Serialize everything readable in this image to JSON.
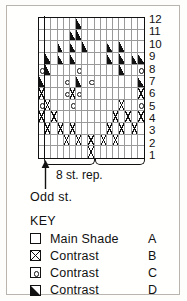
{
  "chart_data": {
    "type": "table",
    "rows": 12,
    "columns": 17,
    "row_labels": [
      "12",
      "11",
      "10",
      "9",
      "8",
      "7",
      "6",
      "5",
      "4",
      "3",
      "2",
      "1"
    ],
    "row_label_position": "right",
    "odd_stitch_columns": 1,
    "repeat_width": 8,
    "repeat_count": 2,
    "symbols": {
      "A": "blank",
      "B": "cross",
      "C": "circle",
      "D": "triangle"
    },
    "legend_position": "bottom",
    "grid": [
      {
        "row": "12",
        "cells": [
          "A",
          "A",
          "A",
          "A",
          "A",
          "A",
          "D",
          "A",
          "A",
          "A",
          "A",
          "A",
          "A",
          "A",
          "A",
          "A",
          "A"
        ]
      },
      {
        "row": "11",
        "cells": [
          "A",
          "A",
          "A",
          "A",
          "A",
          "D",
          "D",
          "A",
          "A",
          "A",
          "A",
          "A",
          "A",
          "A",
          "A",
          "A",
          "A"
        ]
      },
      {
        "row": "10",
        "cells": [
          "A",
          "A",
          "A",
          "D",
          "A",
          "D",
          "A",
          "D",
          "A",
          "A",
          "A",
          "D",
          "A",
          "D",
          "A",
          "A",
          "A"
        ]
      },
      {
        "row": "9",
        "cells": [
          "A",
          "D",
          "A",
          "D",
          "A",
          "D",
          "A",
          "A",
          "A",
          "A",
          "A",
          "D",
          "A",
          "D",
          "A",
          "D",
          "D"
        ]
      },
      {
        "row": "8",
        "cells": [
          "C",
          "D",
          "A",
          "A",
          "A",
          "A",
          "C",
          "A",
          "A",
          "A",
          "A",
          "A",
          "A",
          "D",
          "A",
          "A",
          "C"
        ]
      },
      {
        "row": "7",
        "cells": [
          "D",
          "A",
          "A",
          "A",
          "C",
          "A",
          "D",
          "A",
          "C",
          "A",
          "A",
          "A",
          "A",
          "A",
          "A",
          "A",
          "D"
        ]
      },
      {
        "row": "6",
        "cells": [
          "B",
          "A",
          "A",
          "A",
          "C",
          "B",
          "C",
          "A",
          "A",
          "A",
          "A",
          "A",
          "A",
          "A",
          "A",
          "A",
          "B"
        ]
      },
      {
        "row": "5",
        "cells": [
          "C",
          "B",
          "A",
          "A",
          "A",
          "C",
          "A",
          "A",
          "A",
          "A",
          "A",
          "A",
          "A",
          "B",
          "A",
          "A",
          "C"
        ]
      },
      {
        "row": "4",
        "cells": [
          "B",
          "A",
          "B",
          "A",
          "A",
          "A",
          "A",
          "A",
          "A",
          "A",
          "A",
          "A",
          "B",
          "A",
          "B",
          "A",
          "B"
        ]
      },
      {
        "row": "3",
        "cells": [
          "A",
          "B",
          "A",
          "B",
          "A",
          "B",
          "A",
          "A",
          "A",
          "A",
          "A",
          "B",
          "A",
          "B",
          "A",
          "B",
          "A"
        ]
      },
      {
        "row": "2",
        "cells": [
          "A",
          "A",
          "A",
          "A",
          "B",
          "A",
          "B",
          "A",
          "B",
          "A",
          "B",
          "A",
          "B",
          "A",
          "A",
          "A",
          "A"
        ]
      },
      {
        "row": "1",
        "cells": [
          "A",
          "A",
          "A",
          "A",
          "A",
          "A",
          "A",
          "A",
          "B",
          "A",
          "A",
          "A",
          "A",
          "A",
          "A",
          "A",
          "A"
        ]
      }
    ]
  },
  "chart": {
    "repeat_label": "8 st. rep.",
    "odd_stitch_label": "Odd st."
  },
  "key": {
    "title": "KEY",
    "items": [
      {
        "symbol": "A",
        "label": "Main Shade",
        "letter": "A"
      },
      {
        "symbol": "B",
        "label": "Contrast",
        "letter": "B"
      },
      {
        "symbol": "C",
        "label": "Contrast",
        "letter": "C"
      },
      {
        "symbol": "D",
        "label": "Contrast",
        "letter": "D"
      }
    ]
  }
}
